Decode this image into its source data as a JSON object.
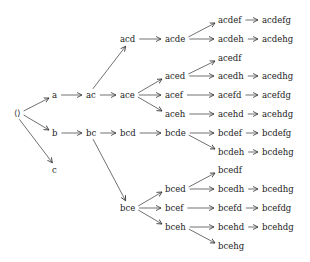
{
  "diagram": {
    "type": "tree",
    "nodes": [
      {
        "id": "root",
        "label": "⟨⟩",
        "x": 14,
        "y": 113
      },
      {
        "id": "a",
        "label": "a",
        "x": 52,
        "y": 95
      },
      {
        "id": "b",
        "label": "b",
        "x": 52,
        "y": 133
      },
      {
        "id": "c",
        "label": "c",
        "x": 52,
        "y": 170
      },
      {
        "id": "ac",
        "label": "ac",
        "x": 86,
        "y": 95
      },
      {
        "id": "bc",
        "label": "bc",
        "x": 86,
        "y": 133
      },
      {
        "id": "acd",
        "label": "acd",
        "x": 120,
        "y": 39
      },
      {
        "id": "ace",
        "label": "ace",
        "x": 120,
        "y": 95
      },
      {
        "id": "bcd",
        "label": "bcd",
        "x": 120,
        "y": 133
      },
      {
        "id": "bce",
        "label": "bce",
        "x": 120,
        "y": 208
      },
      {
        "id": "acde",
        "label": "acde",
        "x": 165,
        "y": 39
      },
      {
        "id": "aced",
        "label": "aced",
        "x": 165,
        "y": 76
      },
      {
        "id": "acef",
        "label": "acef",
        "x": 165,
        "y": 95
      },
      {
        "id": "aceh",
        "label": "aceh",
        "x": 165,
        "y": 114
      },
      {
        "id": "bcde",
        "label": "bcde",
        "x": 165,
        "y": 133
      },
      {
        "id": "bced",
        "label": "bced",
        "x": 165,
        "y": 189
      },
      {
        "id": "bcef",
        "label": "bcef",
        "x": 165,
        "y": 208
      },
      {
        "id": "bceh",
        "label": "bceh",
        "x": 165,
        "y": 227
      },
      {
        "id": "acdef",
        "label": "acdef",
        "x": 218,
        "y": 20
      },
      {
        "id": "acdeh",
        "label": "acdeh",
        "x": 218,
        "y": 39
      },
      {
        "id": "acedf",
        "label": "acedf",
        "x": 218,
        "y": 58
      },
      {
        "id": "acedh",
        "label": "acedh",
        "x": 218,
        "y": 76
      },
      {
        "id": "acefd",
        "label": "acefd",
        "x": 218,
        "y": 95
      },
      {
        "id": "acehd",
        "label": "acehd",
        "x": 218,
        "y": 114
      },
      {
        "id": "bcdef",
        "label": "bcdef",
        "x": 218,
        "y": 133
      },
      {
        "id": "bcdeh",
        "label": "bcdeh",
        "x": 218,
        "y": 152
      },
      {
        "id": "bcedf",
        "label": "bcedf",
        "x": 218,
        "y": 170
      },
      {
        "id": "bcedh",
        "label": "bcedh",
        "x": 218,
        "y": 189
      },
      {
        "id": "bcefd",
        "label": "bcefd",
        "x": 218,
        "y": 208
      },
      {
        "id": "bcehd",
        "label": "bcehd",
        "x": 218,
        "y": 227
      },
      {
        "id": "bcehg",
        "label": "bcehg",
        "x": 218,
        "y": 246
      },
      {
        "id": "acdefg",
        "label": "acdefg",
        "x": 262,
        "y": 20
      },
      {
        "id": "acdehg",
        "label": "acdehg",
        "x": 262,
        "y": 39
      },
      {
        "id": "acedhg",
        "label": "acedhg",
        "x": 262,
        "y": 76
      },
      {
        "id": "acefdg",
        "label": "acefdg",
        "x": 262,
        "y": 95
      },
      {
        "id": "acehdg",
        "label": "acehdg",
        "x": 262,
        "y": 114
      },
      {
        "id": "bcdefg",
        "label": "bcdefg",
        "x": 262,
        "y": 133
      },
      {
        "id": "bcdehg",
        "label": "bcdehg",
        "x": 262,
        "y": 152
      },
      {
        "id": "bcedhg",
        "label": "bcedhg",
        "x": 262,
        "y": 189
      },
      {
        "id": "bcefdg",
        "label": "bcefdg",
        "x": 262,
        "y": 208
      },
      {
        "id": "bcehdg",
        "label": "bcehdg",
        "x": 262,
        "y": 227
      }
    ],
    "edges": [
      [
        "root",
        "a"
      ],
      [
        "root",
        "b"
      ],
      [
        "root",
        "c"
      ],
      [
        "a",
        "ac"
      ],
      [
        "b",
        "bc"
      ],
      [
        "ac",
        "acd"
      ],
      [
        "ac",
        "ace"
      ],
      [
        "bc",
        "bcd"
      ],
      [
        "bc",
        "bce"
      ],
      [
        "acd",
        "acde"
      ],
      [
        "ace",
        "aced"
      ],
      [
        "ace",
        "acef"
      ],
      [
        "ace",
        "aceh"
      ],
      [
        "bcd",
        "bcde"
      ],
      [
        "bce",
        "bced"
      ],
      [
        "bce",
        "bcef"
      ],
      [
        "bce",
        "bceh"
      ],
      [
        "acde",
        "acdef"
      ],
      [
        "acde",
        "acdeh"
      ],
      [
        "aced",
        "acedf"
      ],
      [
        "aced",
        "acedh"
      ],
      [
        "acef",
        "acefd"
      ],
      [
        "aceh",
        "acehd"
      ],
      [
        "bcde",
        "bcdef"
      ],
      [
        "bcde",
        "bcdeh"
      ],
      [
        "bced",
        "bcedf"
      ],
      [
        "bced",
        "bcedh"
      ],
      [
        "bcef",
        "bcefd"
      ],
      [
        "bceh",
        "bcehd"
      ],
      [
        "bceh",
        "bcehg"
      ],
      [
        "acdef",
        "acdefg"
      ],
      [
        "acdeh",
        "acdehg"
      ],
      [
        "acedh",
        "acedhg"
      ],
      [
        "acefd",
        "acefdg"
      ],
      [
        "acehd",
        "acehdg"
      ],
      [
        "bcdef",
        "bcdefg"
      ],
      [
        "bcdeh",
        "bcdehg"
      ],
      [
        "bcedh",
        "bcedhg"
      ],
      [
        "bcefd",
        "bcefdg"
      ],
      [
        "bcehd",
        "bcehdg"
      ]
    ],
    "colors": {
      "text": "#222222",
      "edge": "#333333",
      "background": "#ffffff"
    }
  }
}
